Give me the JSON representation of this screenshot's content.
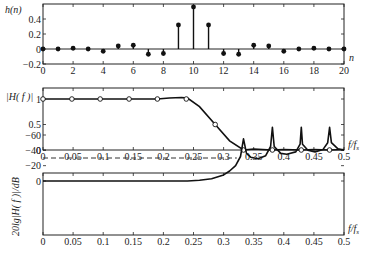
{
  "chart_data": [
    {
      "type": "stem",
      "title": "",
      "ylabel": "h(n)",
      "xlabel": "n",
      "xlim": [
        0,
        20
      ],
      "ylim": [
        -0.2,
        0.6
      ],
      "xticks": [
        "0",
        "2",
        "4",
        "6",
        "8",
        "10",
        "12",
        "14",
        "16",
        "18",
        "20"
      ],
      "yticks": [
        "-0.2",
        "0",
        "0.2",
        "0.4"
      ],
      "x": [
        0,
        1,
        2,
        3,
        4,
        5,
        6,
        7,
        8,
        9,
        10,
        11,
        12,
        13,
        14,
        15,
        16,
        17,
        18,
        19,
        20
      ],
      "values": [
        0,
        0,
        0.01,
        0,
        -0.03,
        0.04,
        0.05,
        -0.07,
        -0.06,
        0.32,
        0.56,
        0.32,
        -0.06,
        -0.07,
        0.05,
        0.04,
        -0.03,
        0,
        0.01,
        0,
        0
      ]
    },
    {
      "type": "line",
      "title": "",
      "ylabel": "|H(f)|",
      "xlabel": "f/fs",
      "xlim": [
        0,
        0.5
      ],
      "ylim": [
        0,
        1.1
      ],
      "xticks": [
        "0",
        "0.05",
        "0.1",
        "0.15",
        "0.2",
        "0.25",
        "0.3",
        "0.35",
        "0.4",
        "0.45",
        "0.5"
      ],
      "yticks": [
        "0",
        "0.5",
        "1"
      ],
      "sample_points": {
        "x": [
          0,
          0.048,
          0.095,
          0.143,
          0.19,
          0.238,
          0.286,
          0.333,
          0.381,
          0.429,
          0.476
        ],
        "values": [
          1,
          1,
          1,
          1,
          1,
          1.0,
          0.5,
          0,
          0,
          0,
          0
        ]
      },
      "curve": {
        "x": [
          0,
          0.05,
          0.1,
          0.15,
          0.19,
          0.21,
          0.23,
          0.24,
          0.26,
          0.286,
          0.31,
          0.333,
          0.35,
          0.38,
          0.4,
          0.43,
          0.45,
          0.476,
          0.5
        ],
        "values": [
          1,
          1,
          1,
          1,
          1,
          1.02,
          1.03,
          1.02,
          0.85,
          0.5,
          0.18,
          0,
          0.02,
          0,
          0.01,
          0,
          0.01,
          0,
          0.01
        ]
      }
    },
    {
      "type": "line",
      "title": "",
      "ylabel": "20lg|H(f)|/dB",
      "xlabel": "f/fs",
      "xlim": [
        0,
        0.5
      ],
      "ylim": [
        -70,
        10
      ],
      "xticks": [
        "0",
        "0.05",
        "0.1",
        "0.15",
        "0.2",
        "0.25",
        "0.3",
        "0.35",
        "0.4",
        "0.45",
        "0.5"
      ],
      "yticks": [
        "0",
        "-20",
        "-40",
        "-60"
      ],
      "reference_line_db": -30,
      "curve": {
        "x": [
          0,
          0.1,
          0.2,
          0.24,
          0.26,
          0.28,
          0.3,
          0.31,
          0.32,
          0.328,
          0.333,
          0.338,
          0.345,
          0.357,
          0.37,
          0.378,
          0.381,
          0.384,
          0.395,
          0.405,
          0.42,
          0.427,
          0.429,
          0.431,
          0.44,
          0.452,
          0.465,
          0.473,
          0.476,
          0.479,
          0.49,
          0.5
        ],
        "values": [
          0,
          0,
          0,
          0,
          -1,
          -3,
          -8,
          -13,
          -20,
          -32,
          -55,
          -36,
          -31,
          -29,
          -33,
          -45,
          -70,
          -45,
          -36,
          -35,
          -38,
          -48,
          -70,
          -48,
          -40,
          -38,
          -41,
          -50,
          -70,
          -50,
          -42,
          -40
        ]
      }
    }
  ],
  "labels": {
    "p1_ylabel": "h(n)",
    "p1_xlabel": "n",
    "p2_ylabel": "|H( f )|",
    "p2_xlabel": "f/f",
    "p2_xlabel_sub": "s",
    "p3_ylabel": "20lg|H( f )|/dB",
    "p3_xlabel": "f/f",
    "p3_xlabel_sub": "s"
  }
}
